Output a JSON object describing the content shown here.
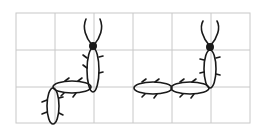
{
  "figure": {
    "grid": {
      "left": 16,
      "top": 13,
      "cell_w": 39,
      "cell_h": 37,
      "cols": 6,
      "rows": 3,
      "line_color": "#c8c8c8"
    },
    "stroke_color": "#1a1a1a",
    "figures": [
      {
        "name": "left-figure",
        "head": {
          "cx": 93,
          "cy": 46
        },
        "segments": [
          {
            "cx": 93,
            "cy": 73,
            "rx": 7,
            "ry": 26,
            "rot": 0
          },
          {
            "cx": 73,
            "cy": 87,
            "rx": 20,
            "ry": 7,
            "rot": 0
          },
          {
            "cx": 52,
            "cy": 105,
            "rx": 7,
            "ry": 20,
            "rot": 0
          }
        ]
      },
      {
        "name": "right-figure",
        "head": {
          "cx": 210,
          "cy": 46
        },
        "segments": [
          {
            "cx": 210,
            "cy": 73,
            "rx": 7,
            "ry": 26,
            "rot": 0
          },
          {
            "cx": 190,
            "cy": 87,
            "rx": 20,
            "ry": 7,
            "rot": 0
          },
          {
            "cx": 153,
            "cy": 87,
            "rx": 20,
            "ry": 7,
            "rot": 0
          }
        ]
      }
    ]
  }
}
